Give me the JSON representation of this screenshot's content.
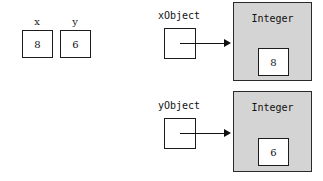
{
  "diagram": {
    "colors": {
      "object_fill": "#d4d4d4",
      "box_fill": "#ffffff",
      "stroke": "#1c1c1c",
      "background": "#ffffff"
    },
    "primitive_variables": [
      {
        "name": "x",
        "value": "8"
      },
      {
        "name": "y",
        "value": "6"
      }
    ],
    "reference_variables": [
      {
        "name": "xObject",
        "points_to": "Integer",
        "value": "8"
      },
      {
        "name": "yObject",
        "points_to": "Integer",
        "value": "6"
      }
    ],
    "objects": [
      {
        "class_name": "Integer",
        "field_value": "8"
      },
      {
        "class_name": "Integer",
        "field_value": "6"
      }
    ]
  }
}
